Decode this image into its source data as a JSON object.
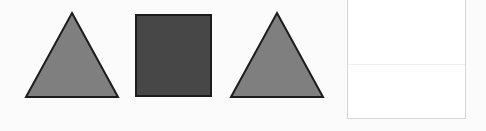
{
  "canvas": {
    "width": 486,
    "height": 131,
    "background_color": "#fbfbfc"
  },
  "palette": {
    "triangle_fill": "#7f7f7f",
    "triangle_stroke": "#1c1c1c",
    "square_fill": "#474747",
    "square_stroke": "#1c1c1c",
    "panel_fill": "#ffffff",
    "panel_border": "#d6d6d8",
    "panel_divider": "#f0f0f1"
  },
  "shapes": [
    {
      "id": "triangle-left",
      "name": "triangle",
      "label": "Triangle",
      "fill": "#7f7f7f",
      "stroke": "#1c1c1c",
      "stroke_width": 2,
      "x": 24,
      "y": 11,
      "width": 96,
      "height": 88,
      "points": "48,2 94,86 2,86"
    },
    {
      "id": "square-middle",
      "name": "square",
      "label": "Square",
      "fill": "#474747",
      "stroke": "#1c1c1c",
      "stroke_width": 2,
      "x": 135,
      "y": 14,
      "width": 78,
      "height": 84,
      "points": "1,1 76,1 76,82 1,82"
    },
    {
      "id": "triangle-right",
      "name": "triangle",
      "label": "Triangle",
      "fill": "#7f7f7f",
      "stroke": "#1c1c1c",
      "stroke_width": 2,
      "x": 229,
      "y": 11,
      "width": 96,
      "height": 88,
      "points": "48,2 94,86 2,86"
    }
  ],
  "panel": {
    "id": "panel-right",
    "name": "blank-panel",
    "label": "",
    "x": 347,
    "y": -10,
    "width": 119,
    "height": 129,
    "fill": "#ffffff",
    "border_color": "#d6d6d8",
    "divider_offset": 73
  }
}
